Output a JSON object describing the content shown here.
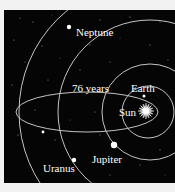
{
  "diagram": {
    "colors": {
      "background": "#f2f2f2",
      "space": "#050505",
      "orbit": "#d8d8d8",
      "label": "#ffffff"
    },
    "labels": {
      "neptune": "Neptune",
      "comet_period": "76 years",
      "earth": "Earth",
      "sun": "Sun",
      "jupiter": "Jupiter",
      "uranus": "Uranus"
    },
    "bodies": [
      {
        "name": "Sun",
        "icon": "sun-star-icon"
      },
      {
        "name": "Earth",
        "icon": "planet-dot-icon"
      },
      {
        "name": "Jupiter",
        "icon": "planet-dot-icon"
      },
      {
        "name": "Uranus",
        "icon": "planet-dot-icon"
      },
      {
        "name": "Neptune",
        "icon": "planet-dot-icon"
      },
      {
        "name": "Comet",
        "icon": "planet-dot-icon"
      }
    ]
  }
}
